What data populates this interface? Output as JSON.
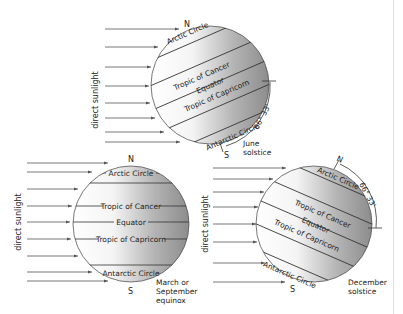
{
  "diagram": {
    "type": "earth-seasons-sunlight",
    "common": {
      "sunlight_label": "direct sunlight",
      "north_label": "N",
      "south_label": "S",
      "latitude_lines": [
        "Arctic Circle",
        "Tropic of Cancer",
        "Equator",
        "Tropic of Capricorn",
        "Antarctic Circle"
      ]
    },
    "panels": [
      {
        "id": "june",
        "caption_line1": "June",
        "caption_line2": "solstice",
        "angle_label": "66° 33'",
        "tilt": "north-pole-toward-sun",
        "labels": {
          "arctic": "Arctic Circle",
          "cancer": "Tropic of Cancer",
          "equator": "Equator",
          "capricorn": "Tropic of Capricorn",
          "antarctic": "Antarctic Circle"
        }
      },
      {
        "id": "equinox",
        "caption_line1": "March or",
        "caption_line2": "September",
        "caption_line3": "equinox",
        "tilt": "none",
        "labels": {
          "arctic": "Arctic Circle",
          "cancer": "Tropic of Cancer",
          "equator": "Equator",
          "capricorn": "Tropic of Capricorn",
          "antarctic": "Antarctic Circle"
        }
      },
      {
        "id": "december",
        "caption_line1": "December",
        "caption_line2": "solstice",
        "angle_label": "66° 33'",
        "tilt": "north-pole-away-from-sun",
        "labels": {
          "arctic": "Arctic Circle",
          "cancer": "Tropic of Cancer",
          "equator": "Equator",
          "capricorn": "Tropic of Capricorn",
          "antarctic": "Antarctic Circle"
        }
      }
    ],
    "colors": {
      "globe_light": "#ffffff",
      "globe_dark": "#8c8c8c",
      "line": "#333333",
      "arrow": "#555555"
    }
  }
}
